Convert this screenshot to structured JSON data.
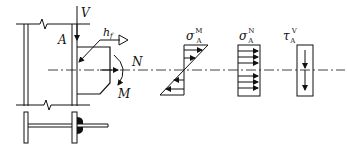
{
  "diagram": {
    "labels": {
      "shear_force": "V",
      "point": "A",
      "weld_size_base": "h",
      "weld_size_sub": "f",
      "axial_force": "N",
      "moment": "M"
    },
    "stress_diagrams": [
      {
        "symbol": "σ",
        "superscript": "M",
        "subscript": "A",
        "type": "linear-bending"
      },
      {
        "symbol": "σ",
        "superscript": "N",
        "subscript": "A",
        "type": "uniform-axial"
      },
      {
        "symbol": "τ",
        "superscript": "V",
        "subscript": "A",
        "type": "uniform-shear"
      }
    ],
    "colors": {
      "line": "#111111",
      "background": "#ffffff"
    }
  }
}
